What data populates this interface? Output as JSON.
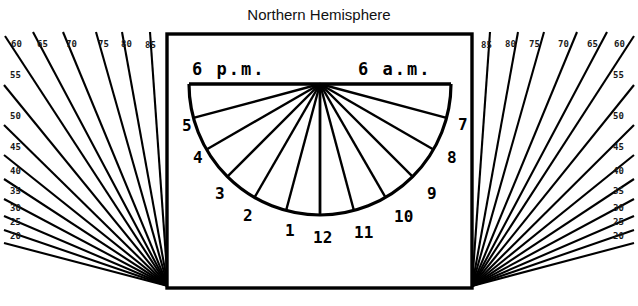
{
  "title": "Northern Hemisphere",
  "dial": {
    "left_period_label": "6 p.m.",
    "right_period_label": "6 a.m.",
    "center": {
      "x": 320,
      "y": 84
    },
    "radius": 131,
    "hour_marks": [
      {
        "label": "5",
        "angle_deg": 165,
        "lx": 182,
        "ly": 131
      },
      {
        "label": "4",
        "angle_deg": 150,
        "lx": 193,
        "ly": 163
      },
      {
        "label": "3",
        "angle_deg": 135,
        "lx": 215,
        "ly": 199
      },
      {
        "label": "2",
        "angle_deg": 120,
        "lx": 243,
        "ly": 221
      },
      {
        "label": "1",
        "angle_deg": 105,
        "lx": 285,
        "ly": 236
      },
      {
        "label": "12",
        "angle_deg": 90,
        "lx": 313,
        "ly": 243
      },
      {
        "label": "11",
        "angle_deg": 75,
        "lx": 354,
        "ly": 238
      },
      {
        "label": "10",
        "angle_deg": 60,
        "lx": 394,
        "ly": 222
      },
      {
        "label": "9",
        "angle_deg": 45,
        "lx": 427,
        "ly": 199
      },
      {
        "label": "8",
        "angle_deg": 30,
        "lx": 447,
        "ly": 163
      },
      {
        "label": "7",
        "angle_deg": 15,
        "lx": 458,
        "ly": 130
      }
    ]
  },
  "box": {
    "x": 167,
    "y": 34,
    "width": 305,
    "height": 254
  },
  "fans": {
    "left": {
      "origin": {
        "x": 168,
        "y": 286
      },
      "rays": [
        {
          "label": "85",
          "tx": 145,
          "ty": 48,
          "x2": 150,
          "y2": 32
        },
        {
          "label": "80",
          "tx": 121,
          "ty": 47,
          "x2": 122,
          "y2": 32
        },
        {
          "label": "75",
          "tx": 98,
          "ty": 47,
          "x2": 96,
          "y2": 32
        },
        {
          "label": "70",
          "tx": 66,
          "ty": 47,
          "x2": 63,
          "y2": 32
        },
        {
          "label": "65",
          "tx": 37,
          "ty": 47,
          "x2": 33,
          "y2": 32
        },
        {
          "label": "60",
          "tx": 11,
          "ty": 47,
          "x2": 5,
          "y2": 36
        },
        {
          "label": "55",
          "tx": 10,
          "ty": 78,
          "x2": 4,
          "y2": 85
        },
        {
          "label": "50",
          "tx": 10,
          "ty": 119,
          "x2": 4,
          "y2": 125
        },
        {
          "label": "45",
          "tx": 10,
          "ty": 150,
          "x2": 4,
          "y2": 155
        },
        {
          "label": "40",
          "tx": 10,
          "ty": 174,
          "x2": 4,
          "y2": 179
        },
        {
          "label": "35",
          "tx": 10,
          "ty": 194,
          "x2": 4,
          "y2": 199
        },
        {
          "label": "30",
          "tx": 10,
          "ty": 211,
          "x2": 4,
          "y2": 216
        },
        {
          "label": "25",
          "tx": 10,
          "ty": 225,
          "x2": 4,
          "y2": 230
        },
        {
          "label": "20",
          "tx": 10,
          "ty": 239,
          "x2": 4,
          "y2": 243
        }
      ]
    },
    "right": {
      "origin": {
        "x": 472,
        "y": 286
      },
      "rays": [
        {
          "label": "85",
          "tx": 481,
          "ty": 48,
          "x2": 490,
          "y2": 32
        },
        {
          "label": "80",
          "tx": 505,
          "ty": 47,
          "x2": 518,
          "y2": 32
        },
        {
          "label": "75",
          "tx": 529,
          "ty": 47,
          "x2": 544,
          "y2": 32
        },
        {
          "label": "70",
          "tx": 558,
          "ty": 47,
          "x2": 577,
          "y2": 32
        },
        {
          "label": "65",
          "tx": 587,
          "ty": 47,
          "x2": 607,
          "y2": 32
        },
        {
          "label": "60",
          "tx": 614,
          "ty": 47,
          "x2": 634,
          "y2": 36
        },
        {
          "label": "55",
          "tx": 613,
          "ty": 78,
          "x2": 634,
          "y2": 85
        },
        {
          "label": "50",
          "tx": 613,
          "ty": 119,
          "x2": 634,
          "y2": 125
        },
        {
          "label": "45",
          "tx": 613,
          "ty": 150,
          "x2": 634,
          "y2": 155
        },
        {
          "label": "40",
          "tx": 613,
          "ty": 174,
          "x2": 634,
          "y2": 179
        },
        {
          "label": "35",
          "tx": 613,
          "ty": 194,
          "x2": 634,
          "y2": 199
        },
        {
          "label": "30",
          "tx": 613,
          "ty": 211,
          "x2": 634,
          "y2": 216
        },
        {
          "label": "25",
          "tx": 613,
          "ty": 225,
          "x2": 634,
          "y2": 230
        },
        {
          "label": "20",
          "tx": 613,
          "ty": 239,
          "x2": 634,
          "y2": 243
        }
      ]
    }
  },
  "colors": {
    "ink": "#000000",
    "background": "#ffffff"
  }
}
